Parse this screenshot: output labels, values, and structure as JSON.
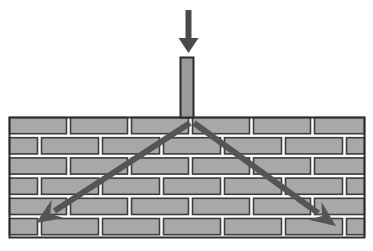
{
  "figure": {
    "name": "masonry-wall-load-spread-diagram",
    "width": 373,
    "height": 251,
    "background_color": "#ffffff"
  },
  "colors": {
    "background": "#ffffff",
    "brick_fill": "#a8a8a8",
    "brick_outline": "#3d3d3d",
    "mortar_joint": "#ffffff",
    "wall_border": "#2e2e2e",
    "column_fill": "#9a9a9a",
    "column_outline": "#2b2b2b",
    "arrow_dark": "#4a4a4a",
    "load_arrow": "#4a4a4a",
    "crack_arrow": "#555555"
  },
  "wall": {
    "label": "masonry-brick-wall",
    "x": 9,
    "y": 117,
    "width": 356,
    "height": 121,
    "course_count": 6,
    "course_height": 20.2,
    "bond_pattern": "running-bond",
    "brick_nominal_width": 58,
    "joint_width": 3,
    "courses": [
      {
        "index": 0,
        "offset": 0,
        "note": "header course, starts flush at left edge"
      },
      {
        "index": 1,
        "offset": 29,
        "note": "stretcher course, half-brick offset"
      },
      {
        "index": 2,
        "offset": 0,
        "note": "header course aligned with course 0"
      },
      {
        "index": 3,
        "offset": 29,
        "note": "stretcher course, half-brick offset"
      },
      {
        "index": 4,
        "offset": 0,
        "note": "header course aligned with course 0"
      },
      {
        "index": 5,
        "offset": 29,
        "note": "bottom stretcher course, half-brick offset"
      }
    ]
  },
  "column": {
    "label": "loaded-column-bearing",
    "x": 180,
    "y": 57,
    "width": 14,
    "height": 61,
    "fill": "#9a9a9a",
    "outline": "#2b2b2b"
  },
  "load_arrow": {
    "label": "applied-load-arrow",
    "direction": "down",
    "shaft_x": 188.5,
    "shaft_top_y": 10,
    "shaft_bottom_y": 38,
    "shaft_width": 6,
    "head_tip_y": 53,
    "head_half_width": 10,
    "color": "#4a4a4a"
  },
  "crack_arrows": [
    {
      "label": "load-spread-arrow-left",
      "direction": "down-left",
      "start_x": 190,
      "start_y": 123,
      "end_x": 36,
      "end_y": 223,
      "shaft_width": 6,
      "head_length": 26,
      "head_half_width": 11,
      "color": "#555555"
    },
    {
      "label": "load-spread-arrow-right",
      "direction": "down-right",
      "start_x": 194,
      "start_y": 123,
      "end_x": 336,
      "end_y": 226,
      "shaft_width": 6,
      "head_length": 26,
      "head_half_width": 11,
      "color": "#555555"
    }
  ],
  "annotations": {
    "title": "",
    "caption": "",
    "labels": []
  }
}
